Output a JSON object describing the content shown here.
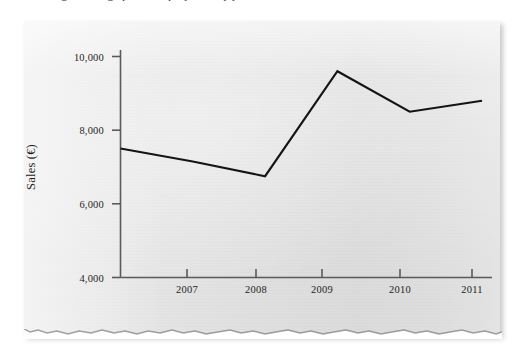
{
  "caption": {
    "text": "Figure: line graph of company sales by year"
  },
  "chart_data": {
    "type": "line",
    "title": "",
    "xlabel": "",
    "ylabel": "Sales (€)",
    "x": [
      2006,
      2007,
      2008,
      2009,
      2010,
      2011
    ],
    "categories": [
      "2006",
      "2007",
      "2008",
      "2009",
      "2010",
      "2011"
    ],
    "values": [
      7500,
      7150,
      6750,
      9600,
      8500,
      8800
    ],
    "series": [
      {
        "name": "Sales",
        "values": [
          7500,
          7150,
          6750,
          9600,
          8500,
          8800
        ]
      }
    ],
    "xtick_labels": [
      "2007",
      "2008",
      "2009",
      "2010",
      "2011"
    ],
    "xticks": [
      2007,
      2008,
      2009,
      2010,
      2011
    ],
    "ytick_labels": [
      "10,000",
      "8,000",
      "6,000",
      "4,000"
    ],
    "yticks": [
      10000,
      8000,
      6000,
      4000
    ],
    "ylim": [
      4000,
      10400
    ],
    "xlim": [
      2006,
      2011.3
    ],
    "grid": false,
    "legend": false,
    "legend_position": "none",
    "line_color": "#141414",
    "axis_color": "#59595c",
    "background_color": "#e6e6e6"
  },
  "axes": {
    "y_label_text": "Sales (€)",
    "y_ticks": [
      {
        "label": "10,000",
        "value": 10000
      },
      {
        "label": "8,000",
        "value": 8000
      },
      {
        "label": "6,000",
        "value": 6000
      },
      {
        "label": "4,000",
        "value": 4000
      }
    ],
    "x_ticks": [
      {
        "label": "2007",
        "value": 2007
      },
      {
        "label": "2008",
        "value": 2008
      },
      {
        "label": "2009",
        "value": 2009
      },
      {
        "label": "2010",
        "value": 2010
      },
      {
        "label": "2011",
        "value": 2011
      }
    ]
  }
}
